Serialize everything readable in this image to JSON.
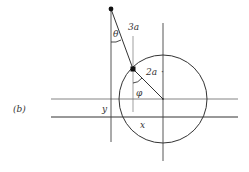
{
  "figure": {
    "panel_label": "(b)",
    "labels": {
      "theta": "θ",
      "three_a": "3a",
      "two_a": "2a",
      "phi": "φ",
      "y": "y",
      "x": "x"
    },
    "colors": {
      "line": "#333333",
      "thin_line": "#666666",
      "background": "#ffffff"
    }
  }
}
